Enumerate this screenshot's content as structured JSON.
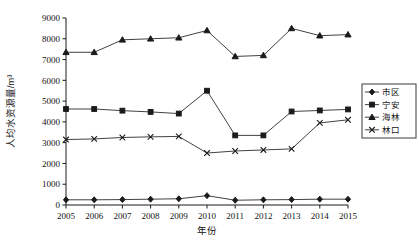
{
  "chart_data": {
    "type": "line",
    "title": "",
    "xlabel": "年份",
    "ylabel": "人均水资源量/m³",
    "grid": false,
    "legend_position": "right",
    "x": [
      2005,
      2006,
      2007,
      2008,
      2009,
      2010,
      2011,
      2012,
      2013,
      2014,
      2015
    ],
    "categories": [
      "2005",
      "2006",
      "2007",
      "2008",
      "2009",
      "2010",
      "2011",
      "2012",
      "2013",
      "2014",
      "2015"
    ],
    "ylim": [
      0,
      9000
    ],
    "yticks": [
      0,
      1000,
      2000,
      3000,
      4000,
      5000,
      6000,
      7000,
      8000,
      9000
    ],
    "ytick_labels": [
      "0",
      "1000",
      "2000",
      "3000",
      "4000",
      "5000",
      "6000",
      "7000",
      "8000",
      "9000"
    ],
    "xlim": [
      2005,
      2015
    ],
    "series": [
      {
        "name": "市区",
        "marker": "diamond",
        "values": [
          250,
          250,
          260,
          280,
          300,
          450,
          230,
          250,
          260,
          280,
          280
        ]
      },
      {
        "name": "宁安",
        "marker": "square",
        "values": [
          4620,
          4620,
          4540,
          4480,
          4400,
          5500,
          3350,
          3350,
          4500,
          4550,
          4600
        ]
      },
      {
        "name": "海林",
        "marker": "triangle",
        "values": [
          7350,
          7350,
          7950,
          8000,
          8050,
          8400,
          7150,
          7200,
          8500,
          8150,
          8200
        ]
      },
      {
        "name": "林口",
        "marker": "cross",
        "values": [
          3150,
          3180,
          3250,
          3280,
          3300,
          2500,
          2600,
          2650,
          2700,
          3950,
          4100
        ]
      }
    ]
  },
  "legend": {
    "items": [
      {
        "label": "市区",
        "marker": "diamond"
      },
      {
        "label": "宁安",
        "marker": "square"
      },
      {
        "label": "海林",
        "marker": "triangle"
      },
      {
        "label": "林口",
        "marker": "cross"
      }
    ]
  },
  "axes": {
    "y_title": "人均水资源量/m³",
    "x_title": "年份"
  }
}
